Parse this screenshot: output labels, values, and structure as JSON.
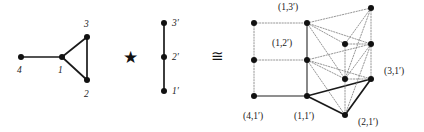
{
  "figure": {
    "operator_star": "★",
    "operator_cong": "≅",
    "colors": {
      "vertex": "#111111",
      "edge_solid": "#1a1a1a",
      "edge_gray": "#6b6b6b",
      "edge_dotted": "#8a8a8a",
      "text": "#1a1a1a",
      "background": "#ffffff"
    }
  },
  "graph_g": {
    "name": "G",
    "vertices": [
      {
        "id": "4",
        "label": "4",
        "x": 21,
        "y": 57,
        "label_x": 17,
        "label_y": 66
      },
      {
        "id": "1",
        "label": "1",
        "x": 62,
        "y": 57,
        "label_x": 58,
        "label_y": 66
      },
      {
        "id": "3",
        "label": "3",
        "x": 87,
        "y": 37,
        "label_x": 84,
        "label_y": 20
      },
      {
        "id": "2",
        "label": "2",
        "x": 87,
        "y": 80,
        "label_x": 84,
        "label_y": 90
      }
    ],
    "edges": [
      {
        "from": "4",
        "to": "1"
      },
      {
        "from": "1",
        "to": "3"
      },
      {
        "from": "1",
        "to": "2"
      },
      {
        "from": "3",
        "to": "2"
      }
    ]
  },
  "graph_h": {
    "name": "H",
    "vertices": [
      {
        "id": "3p",
        "label": "3′",
        "x": 164,
        "y": 23,
        "label_x": 172,
        "label_y": 19
      },
      {
        "id": "2p",
        "label": "2′",
        "x": 164,
        "y": 57,
        "label_x": 172,
        "label_y": 53
      },
      {
        "id": "1p",
        "label": "1′",
        "x": 164,
        "y": 91,
        "label_x": 172,
        "label_y": 87
      }
    ],
    "edges": [
      {
        "from": "3p",
        "to": "2p"
      },
      {
        "from": "2p",
        "to": "1p"
      }
    ]
  },
  "product_graph": {
    "name": "G ★ H",
    "vertices": [
      {
        "id": "4-3p",
        "label": "",
        "x": 254,
        "y": 23,
        "shown": false
      },
      {
        "id": "4-2p",
        "label": "",
        "x": 254,
        "y": 60,
        "shown": false
      },
      {
        "id": "4-1p",
        "label": "(4,1′)",
        "x": 254,
        "y": 96,
        "label_x": 243,
        "label_y": 112,
        "shown": true
      },
      {
        "id": "1-3p",
        "label": "(1,3′)",
        "x": 307,
        "y": 23,
        "label_x": 278,
        "label_y": 3,
        "shown": true
      },
      {
        "id": "1-2p",
        "label": "(1,2′)",
        "x": 307,
        "y": 60,
        "label_x": 272,
        "label_y": 39,
        "shown": true
      },
      {
        "id": "1-1p",
        "label": "(1,1′)",
        "x": 307,
        "y": 96,
        "label_x": 294,
        "label_y": 112,
        "shown": true
      },
      {
        "id": "2-3p",
        "label": "",
        "x": 345,
        "y": 44,
        "shown": false
      },
      {
        "id": "2-2p",
        "label": "",
        "x": 345,
        "y": 79,
        "shown": false
      },
      {
        "id": "2-1p",
        "label": "(2,1′)",
        "x": 345,
        "y": 115,
        "label_x": 358,
        "label_y": 118,
        "shown": true
      },
      {
        "id": "3-3p",
        "label": "",
        "x": 371,
        "y": 8,
        "shown": false
      },
      {
        "id": "3-2p",
        "label": "",
        "x": 371,
        "y": 44,
        "shown": false
      },
      {
        "id": "3-1p",
        "label": "(3,1′)",
        "x": 371,
        "y": 79,
        "label_x": 384,
        "label_y": 67,
        "shown": true
      }
    ],
    "edges": [
      {
        "from": "4-3p",
        "to": "4-2p",
        "style": "dotted"
      },
      {
        "from": "4-2p",
        "to": "4-1p",
        "style": "dotted"
      },
      {
        "from": "4-3p",
        "to": "1-3p",
        "style": "dotted"
      },
      {
        "from": "4-2p",
        "to": "1-2p",
        "style": "dotted"
      },
      {
        "from": "4-1p",
        "to": "1-1p",
        "style": "solid-gray"
      },
      {
        "from": "1-3p",
        "to": "1-2p",
        "style": "solid-gray"
      },
      {
        "from": "1-2p",
        "to": "1-1p",
        "style": "solid-gray"
      },
      {
        "from": "1-3p",
        "to": "2-3p",
        "style": "dotted"
      },
      {
        "from": "1-3p",
        "to": "3-3p",
        "style": "dotted"
      },
      {
        "from": "1-3p",
        "to": "2-2p",
        "style": "dotted"
      },
      {
        "from": "1-3p",
        "to": "3-2p",
        "style": "dotted"
      },
      {
        "from": "1-2p",
        "to": "2-2p",
        "style": "dotted"
      },
      {
        "from": "1-2p",
        "to": "3-2p",
        "style": "dotted"
      },
      {
        "from": "1-2p",
        "to": "2-1p",
        "style": "dotted"
      },
      {
        "from": "1-2p",
        "to": "3-1p",
        "style": "dotted"
      },
      {
        "from": "1-1p",
        "to": "2-1p",
        "style": "solid"
      },
      {
        "from": "1-1p",
        "to": "3-1p",
        "style": "solid"
      },
      {
        "from": "2-3p",
        "to": "3-3p",
        "style": "dotted"
      },
      {
        "from": "2-3p",
        "to": "2-2p",
        "style": "dotted"
      },
      {
        "from": "2-2p",
        "to": "2-1p",
        "style": "dotted"
      },
      {
        "from": "2-2p",
        "to": "3-2p",
        "style": "dotted"
      },
      {
        "from": "2-1p",
        "to": "3-1p",
        "style": "solid"
      },
      {
        "from": "3-3p",
        "to": "3-2p",
        "style": "dotted"
      },
      {
        "from": "3-2p",
        "to": "3-1p",
        "style": "dotted"
      },
      {
        "from": "2-3p",
        "to": "3-2p",
        "style": "dotted"
      },
      {
        "from": "2-2p",
        "to": "3-1p",
        "style": "dotted"
      },
      {
        "from": "3-3p",
        "to": "2-2p",
        "style": "dotted"
      },
      {
        "from": "3-2p",
        "to": "2-1p",
        "style": "dotted"
      }
    ]
  },
  "operators": [
    {
      "id": "star",
      "symbol": "★",
      "x": 123,
      "y": 49
    },
    {
      "id": "cong",
      "symbol": "≅",
      "x": 211,
      "y": 49
    }
  ]
}
